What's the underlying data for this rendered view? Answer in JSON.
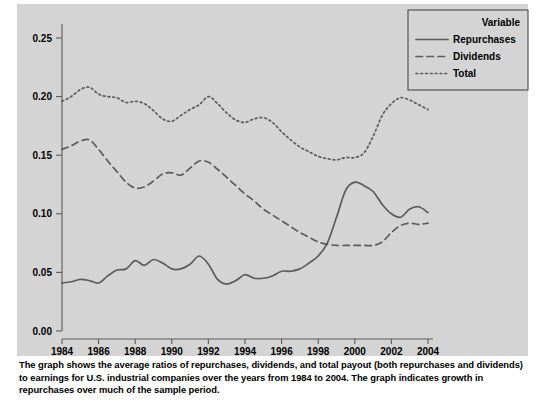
{
  "figure": {
    "caption": "The graph shows the average ratios of repurchases, dividends, and total payout (both repurchases and dividends) to earnings for U.S. industrial companies over the years from 1984 to 2004. The graph indicates growth in repurchases over much of the sample period.",
    "panel_color": "#d4d4d4",
    "line_color": "#5b5b5b"
  },
  "legend": {
    "title": "Variable",
    "entries": [
      {
        "label": "Repurchases",
        "style": "solid"
      },
      {
        "label": "Dividends",
        "style": "dashed"
      },
      {
        "label": "Total",
        "style": "dotted"
      }
    ]
  },
  "chart_data": {
    "type": "line",
    "title": "",
    "xlabel": "",
    "ylabel": "",
    "xlim": [
      1984,
      2004
    ],
    "ylim": [
      0.0,
      0.27
    ],
    "grid": false,
    "legend_position": "top-right",
    "xticks": [
      1984,
      1986,
      1988,
      1990,
      1992,
      1994,
      1996,
      1998,
      2000,
      2002,
      2004
    ],
    "xtick_labels": [
      "1984",
      "1986",
      "1988",
      "1990",
      "1992",
      "1994",
      "1996",
      "1998",
      "2000",
      "2002",
      "2004"
    ],
    "yticks": [
      0.0,
      0.05,
      0.1,
      0.15,
      0.2,
      0.25
    ],
    "ytick_labels": [
      "0.00",
      "0.05",
      "0.10",
      "0.15",
      "0.20",
      "0.25"
    ],
    "x": [
      1984.0,
      1984.5,
      1985.0,
      1985.5,
      1986.0,
      1986.5,
      1987.0,
      1987.5,
      1988.0,
      1988.5,
      1989.0,
      1989.5,
      1990.0,
      1990.5,
      1991.0,
      1991.5,
      1992.0,
      1992.5,
      1993.0,
      1993.5,
      1994.0,
      1994.5,
      1995.0,
      1995.5,
      1996.0,
      1996.5,
      1997.0,
      1997.5,
      1998.0,
      1998.5,
      1999.0,
      1999.5,
      2000.0,
      2000.5,
      2001.0,
      2001.5,
      2002.0,
      2002.5,
      2003.0,
      2003.5,
      2004.0
    ],
    "series": [
      {
        "name": "Repurchases",
        "style": "solid",
        "values": [
          0.041,
          0.042,
          0.044,
          0.043,
          0.041,
          0.047,
          0.052,
          0.053,
          0.06,
          0.056,
          0.061,
          0.058,
          0.053,
          0.053,
          0.057,
          0.064,
          0.057,
          0.044,
          0.04,
          0.043,
          0.048,
          0.045,
          0.045,
          0.047,
          0.051,
          0.051,
          0.053,
          0.058,
          0.064,
          0.075,
          0.097,
          0.12,
          0.127,
          0.124,
          0.119,
          0.108,
          0.1,
          0.097,
          0.104,
          0.106,
          0.101
        ]
      },
      {
        "name": "Dividends",
        "style": "dashed",
        "values": [
          0.155,
          0.158,
          0.162,
          0.163,
          0.155,
          0.145,
          0.136,
          0.127,
          0.122,
          0.123,
          0.128,
          0.134,
          0.135,
          0.133,
          0.139,
          0.145,
          0.144,
          0.138,
          0.131,
          0.124,
          0.117,
          0.111,
          0.104,
          0.099,
          0.094,
          0.089,
          0.084,
          0.08,
          0.076,
          0.074,
          0.073,
          0.073,
          0.073,
          0.073,
          0.073,
          0.076,
          0.084,
          0.09,
          0.092,
          0.091,
          0.092
        ]
      },
      {
        "name": "Total",
        "style": "dotted",
        "values": [
          0.196,
          0.2,
          0.206,
          0.208,
          0.202,
          0.2,
          0.199,
          0.195,
          0.196,
          0.194,
          0.188,
          0.181,
          0.179,
          0.184,
          0.189,
          0.193,
          0.2,
          0.194,
          0.186,
          0.18,
          0.178,
          0.181,
          0.182,
          0.178,
          0.17,
          0.163,
          0.157,
          0.153,
          0.149,
          0.147,
          0.146,
          0.148,
          0.148,
          0.152,
          0.166,
          0.184,
          0.194,
          0.199,
          0.197,
          0.193,
          0.189
        ]
      }
    ]
  }
}
